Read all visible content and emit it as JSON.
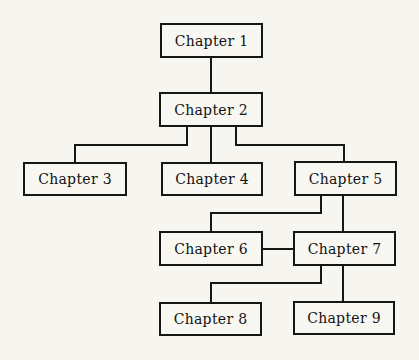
{
  "colors": {
    "ink": "#161616",
    "paper": "#f6f5f0",
    "box_fill": "#f8f7f2"
  },
  "diagram": {
    "nodes": [
      {
        "id": "ch1",
        "label": "Chapter 1",
        "x": 160,
        "y": 23,
        "w": 103,
        "h": 35
      },
      {
        "id": "ch2",
        "label": "Chapter 2",
        "x": 159,
        "y": 92,
        "w": 104,
        "h": 35
      },
      {
        "id": "ch3",
        "label": "Chapter 3",
        "x": 23,
        "y": 162,
        "w": 104,
        "h": 34
      },
      {
        "id": "ch4",
        "label": "Chapter 4",
        "x": 161,
        "y": 162,
        "w": 102,
        "h": 34
      },
      {
        "id": "ch5",
        "label": "Chapter 5",
        "x": 294,
        "y": 161,
        "w": 103,
        "h": 35
      },
      {
        "id": "ch6",
        "label": "Chapter 6",
        "x": 159,
        "y": 231,
        "w": 104,
        "h": 35
      },
      {
        "id": "ch7",
        "label": "Chapter 7",
        "x": 293,
        "y": 231,
        "w": 103,
        "h": 35
      },
      {
        "id": "ch8",
        "label": "Chapter 8",
        "x": 159,
        "y": 302,
        "w": 103,
        "h": 34
      },
      {
        "id": "ch9",
        "label": "Chapter 9",
        "x": 293,
        "y": 301,
        "w": 102,
        "h": 34
      }
    ],
    "edges": [
      {
        "from": "ch1",
        "to": "ch2",
        "points": [
          [
            211,
            57
          ],
          [
            211,
            92
          ]
        ]
      },
      {
        "from": "ch2",
        "to": "ch3",
        "points": [
          [
            187,
            127
          ],
          [
            187,
            145
          ],
          [
            75,
            145
          ],
          [
            75,
            162
          ]
        ]
      },
      {
        "from": "ch2",
        "to": "ch4",
        "points": [
          [
            211,
            127
          ],
          [
            211,
            162
          ]
        ]
      },
      {
        "from": "ch2",
        "to": "ch5",
        "points": [
          [
            236,
            127
          ],
          [
            236,
            145
          ],
          [
            344,
            145
          ],
          [
            344,
            161
          ]
        ]
      },
      {
        "from": "ch5",
        "to": "ch6",
        "points": [
          [
            321,
            196
          ],
          [
            321,
            213
          ],
          [
            211,
            213
          ],
          [
            211,
            231
          ]
        ]
      },
      {
        "from": "ch5",
        "to": "ch7",
        "points": [
          [
            343,
            196
          ],
          [
            343,
            231
          ]
        ]
      },
      {
        "from": "ch6",
        "to": "ch7",
        "points": [
          [
            263,
            249
          ],
          [
            293,
            249
          ]
        ]
      },
      {
        "from": "ch7",
        "to": "ch8",
        "points": [
          [
            321,
            266
          ],
          [
            321,
            283
          ],
          [
            211,
            283
          ],
          [
            211,
            302
          ]
        ]
      },
      {
        "from": "ch7",
        "to": "ch9",
        "points": [
          [
            343,
            266
          ],
          [
            343,
            301
          ]
        ]
      }
    ]
  }
}
